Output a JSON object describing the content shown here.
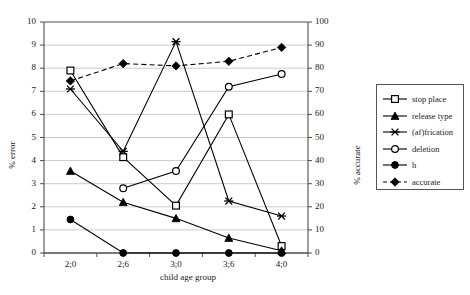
{
  "chart_data": {
    "type": "line",
    "title": "",
    "xlabel": "child age group",
    "ylabel": "% error",
    "ylabel_secondary": "% accurate",
    "categories": [
      "2;0",
      "2;6",
      "3;0",
      "3;6",
      "4;0"
    ],
    "ylim": [
      0,
      10
    ],
    "ylim_secondary": [
      0,
      100
    ],
    "yticks": [
      "10",
      "9",
      "8",
      "7",
      "6",
      "5",
      "4",
      "3",
      "2",
      "1",
      "0"
    ],
    "yticks_secondary": [
      "100",
      "90",
      "80",
      "70",
      "60",
      "50",
      "40",
      "30",
      "20",
      "10",
      "0"
    ],
    "grid": true,
    "legend_position": "right",
    "series": [
      {
        "name": "stop place",
        "marker": "open-square",
        "line": "solid",
        "axis": "left",
        "values": [
          7.9,
          4.15,
          2.05,
          6.0,
          0.3
        ]
      },
      {
        "name": "release type",
        "marker": "filled-triangle",
        "line": "solid",
        "axis": "left",
        "values": [
          3.55,
          2.2,
          1.5,
          0.65,
          0.1
        ]
      },
      {
        "name": "(af)frication",
        "marker": "cross-x",
        "line": "solid",
        "axis": "left",
        "values": [
          7.1,
          4.4,
          9.15,
          2.25,
          1.6
        ]
      },
      {
        "name": "deletion",
        "marker": "open-circle",
        "line": "solid",
        "axis": "left",
        "values": [
          null,
          2.8,
          3.55,
          7.2,
          7.75
        ]
      },
      {
        "name": "h",
        "marker": "filled-circle",
        "line": "solid",
        "axis": "left",
        "values": [
          1.45,
          0.0,
          0.0,
          0.0,
          0.0
        ]
      },
      {
        "name": "accurate",
        "marker": "filled-diamond",
        "line": "dashed",
        "axis": "right",
        "values": [
          74.5,
          82.0,
          81.0,
          83.0,
          89.0
        ]
      }
    ]
  },
  "axes": {
    "left": {
      "label": "% error",
      "ticks": [
        "10",
        "9",
        "8",
        "7",
        "6",
        "5",
        "4",
        "3",
        "2",
        "1",
        "0"
      ]
    },
    "right": {
      "label": "% accurate",
      "ticks": [
        "100",
        "90",
        "80",
        "70",
        "60",
        "50",
        "40",
        "30",
        "20",
        "10",
        "0"
      ]
    },
    "bottom": {
      "label": "child age group",
      "ticks": [
        "2;0",
        "2;6",
        "3;0",
        "3;6",
        "4;0"
      ]
    }
  },
  "legend": {
    "entries": [
      {
        "label": "stop place",
        "marker": "open-square",
        "line": "solid"
      },
      {
        "label": "release type",
        "marker": "filled-triangle",
        "line": "solid"
      },
      {
        "label": "(af)frication",
        "marker": "cross-x",
        "line": "solid"
      },
      {
        "label": "deletion",
        "marker": "open-circle",
        "line": "solid"
      },
      {
        "label": "h",
        "marker": "filled-circle",
        "line": "solid"
      },
      {
        "label": "accurate",
        "marker": "filled-diamond",
        "line": "dashed"
      }
    ]
  },
  "colors": {
    "line": "#000000",
    "grid": "#bdbdbd",
    "axis": "#4d4d4d",
    "text": "#1a1a1a",
    "background": "#ffffff"
  }
}
